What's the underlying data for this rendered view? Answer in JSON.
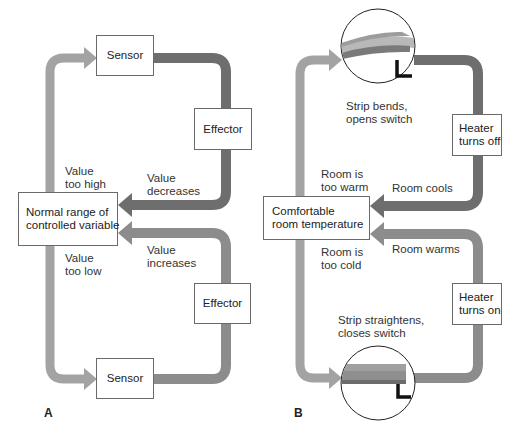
{
  "colors": {
    "arrow_light": "#a3a3a3",
    "arrow_medium": "#8c8c8c",
    "arrow_dark": "#6e6e6e",
    "box_border": "#6a6a6a",
    "strip_top": "#9c9c9c",
    "strip_mid": "#b8b8b8",
    "strip_bottom": "#7a7a7a",
    "switch": "#111111"
  },
  "panel_a": {
    "letter": "A",
    "sensor_top": "Sensor",
    "effector_top": "Effector",
    "normal_range": "Normal range of\ncontrolled variable",
    "effector_bottom": "Effector",
    "sensor_bottom": "Sensor",
    "value_too_high": "Value\ntoo high",
    "value_decreases": "Value\ndecreases",
    "value_too_low": "Value\ntoo low",
    "value_increases": "Value\nincreases"
  },
  "panel_b": {
    "letter": "B",
    "strip_bends": "Strip bends,\nopens switch",
    "heater_off": "Heater\nturns off",
    "room_too_warm": "Room is\ntoo warm",
    "room_cools": "Room cools",
    "comfortable": "Comfortable\nroom temperature",
    "room_too_cold": "Room is\ntoo cold",
    "room_warms": "Room warms",
    "heater_on": "Heater\nturns on",
    "strip_straightens": "Strip straightens,\ncloses switch"
  }
}
